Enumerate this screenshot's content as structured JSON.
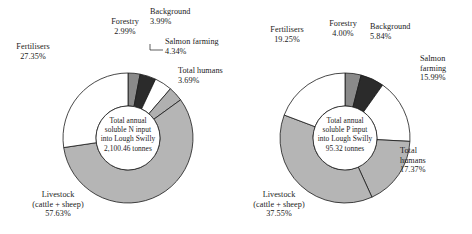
{
  "figure": {
    "background_color": "#ffffff",
    "text_color": "#1a1a1a"
  },
  "charts": [
    {
      "id": "chart-n",
      "center_lines": [
        "Total annual",
        "soluble N input",
        "into Lough Swilly",
        "2,100.46 tonnes"
      ],
      "center_total_value": "2,100.46",
      "center_total_unit": "tonnes",
      "segments": [
        {
          "label": "Forestry",
          "pct": "2.99%",
          "value": 2.99,
          "color": "#8a8a8a"
        },
        {
          "label": "Background",
          "pct": "3.99%",
          "value": 3.99,
          "color": "#2b2b2b"
        },
        {
          "label": "Salmon farming",
          "pct": "4.34%",
          "value": 4.34,
          "color": "#ffffff"
        },
        {
          "label": "Total humans",
          "pct": "3.69%",
          "value": 3.69,
          "color": "#b0b0b0"
        },
        {
          "label": "Livestock (cattle + sheep)",
          "pct": "57.63%",
          "value": 57.63,
          "color": "#b5b5b5"
        },
        {
          "label": "Fertilisers",
          "pct": "27.35%",
          "value": 27.35,
          "color": "#ffffff"
        }
      ]
    },
    {
      "id": "chart-p",
      "center_lines": [
        "Total annual",
        "soluble P input",
        "into Lough Swilly",
        "95.32 tonnes"
      ],
      "center_total_value": "95.32",
      "center_total_unit": "tonnes",
      "segments": [
        {
          "label": "Forestry",
          "pct": "4.00%",
          "value": 4.0,
          "color": "#8a8a8a"
        },
        {
          "label": "Background",
          "pct": "5.84%",
          "value": 5.84,
          "color": "#2b2b2b"
        },
        {
          "label": "Salmon farming",
          "pct": "15.99%",
          "value": 15.99,
          "color": "#ffffff"
        },
        {
          "label": "Total humans",
          "pct": "17.37%",
          "value": 17.37,
          "color": "#b5b5b5"
        },
        {
          "label": "Livestock (cattle + sheep)",
          "pct": "37.55%",
          "value": 37.55,
          "color": "#b5b5b5"
        },
        {
          "label": "Fertilisers",
          "pct": "19.25%",
          "value": 19.25,
          "color": "#ffffff"
        }
      ]
    }
  ],
  "chart_data": [
    {
      "type": "pie",
      "title": "Total annual soluble N input into Lough Swilly 2,100.46 tonnes",
      "subtitle": "",
      "xlabel": "",
      "ylabel": "",
      "donut": true,
      "total": 2100.46,
      "units": "tonnes",
      "legend_position": "around-slices",
      "categories": [
        "Forestry",
        "Background",
        "Salmon farming",
        "Total humans",
        "Livestock (cattle + sheep)",
        "Fertilisers"
      ],
      "values": [
        2.99,
        3.99,
        4.34,
        3.69,
        57.63,
        27.35
      ],
      "value_labels": [
        "2.99%",
        "3.99%",
        "4.34%",
        "3.69%",
        "57.63%",
        "27.35%"
      ],
      "colors": [
        "#8a8a8a",
        "#2b2b2b",
        "#ffffff",
        "#b0b0b0",
        "#b5b5b5",
        "#ffffff"
      ],
      "start_angle_deg": 0,
      "direction": "clockwise"
    },
    {
      "type": "pie",
      "title": "Total annual soluble P input into Lough Swilly 95.32 tonnes",
      "subtitle": "",
      "xlabel": "",
      "ylabel": "",
      "donut": true,
      "total": 95.32,
      "units": "tonnes",
      "legend_position": "around-slices",
      "categories": [
        "Forestry",
        "Background",
        "Salmon farming",
        "Total humans",
        "Livestock (cattle + sheep)",
        "Fertilisers"
      ],
      "values": [
        4.0,
        5.84,
        15.99,
        17.37,
        37.55,
        19.25
      ],
      "value_labels": [
        "4.00%",
        "5.84%",
        "15.99%",
        "17.37%",
        "37.55%",
        "19.25%"
      ],
      "colors": [
        "#8a8a8a",
        "#2b2b2b",
        "#ffffff",
        "#b5b5b5",
        "#b5b5b5",
        "#ffffff"
      ],
      "start_angle_deg": 0,
      "direction": "clockwise"
    }
  ],
  "labels_n": {
    "forestry": {
      "name": "Forestry",
      "pct": "2.99%"
    },
    "background": {
      "name": "Background",
      "pct": "3.99%"
    },
    "salmon_l1": {
      "name": "Salmon farming",
      "pct": "4.34%"
    },
    "humans_l1": {
      "name": "Total humans",
      "pct": "3.69%"
    },
    "fertilisers": {
      "name": "Fertilisers",
      "pct": "27.35%"
    },
    "livestock_l1": {
      "name": "Livestock"
    },
    "livestock_l2": {
      "name": "(cattle + sheep)"
    },
    "livestock_pct": {
      "pct": "57.63%"
    }
  },
  "labels_p": {
    "forestry": {
      "name": "Forestry",
      "pct": "4.00%"
    },
    "background": {
      "name": "Background",
      "pct": "5.84%"
    },
    "salmon_l1": {
      "name": "Salmon"
    },
    "salmon_l2": {
      "name": "farming"
    },
    "salmon_pct": {
      "pct": "15.99%"
    },
    "humans_l1": {
      "name": "Total"
    },
    "humans_l2": {
      "name": "humans"
    },
    "humans_pct": {
      "pct": "17.37%"
    },
    "fertilisers": {
      "name": "Fertilisers",
      "pct": "19.25%"
    },
    "livestock_l1": {
      "name": "Livestock"
    },
    "livestock_l2": {
      "name": "(cattle + sheep)"
    },
    "livestock_pct": {
      "pct": "37.55%"
    }
  }
}
